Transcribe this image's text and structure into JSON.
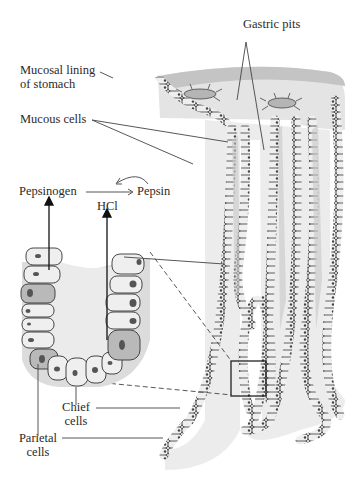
{
  "diagram": {
    "labels": {
      "gastric_pits": "Gastric pits",
      "mucosal_lining_line1": "Mucosal lining",
      "mucosal_lining_line2": "of stomach",
      "mucous_cells": "Mucous cells",
      "pepsinogen": "Pepsinogen",
      "pepsin": "Pepsin",
      "hcl": "HCl",
      "chief_line1": "Chief",
      "chief_line2": "cells",
      "parietal_line1": "Parietal",
      "parietal_line2": "cells"
    },
    "colors": {
      "tissue_light": "#e6e6e6",
      "tissue_mid": "#c8c8c8",
      "tissue_dark": "#a8a8a8",
      "cell_fill": "#efefef",
      "parietal_fill": "#b9b9b9",
      "nucleus": "#555555",
      "outline": "#333333",
      "leader": "#444444"
    },
    "reaction": {
      "reactant": "Pepsinogen",
      "product": "Pepsin",
      "catalyst": "HCl",
      "autocatalytic": true
    }
  }
}
